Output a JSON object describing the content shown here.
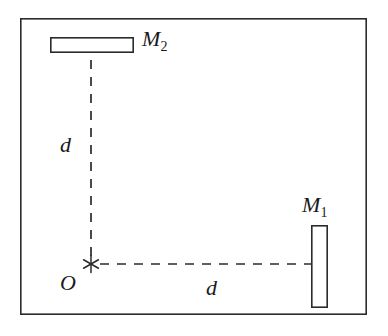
{
  "figure": {
    "background_color": "#ffffff",
    "line_color": "#2b2b2b",
    "text_color": "#1a1a1a",
    "frame": {
      "name": "outer-border",
      "x": 20,
      "y": 18,
      "width": 347,
      "height": 297,
      "stroke_width": 1.6,
      "fill": "#ffffff"
    },
    "mirrors": [
      {
        "id": "m1",
        "label": "M",
        "subscript": "1",
        "orientation": "vertical",
        "x": 311,
        "y": 225,
        "width": 17,
        "height": 83,
        "stroke_width": 1.6,
        "fill": "#ffffff"
      },
      {
        "id": "m2",
        "label": "M",
        "subscript": "2",
        "orientation": "horizontal",
        "x": 50,
        "y": 37,
        "width": 84,
        "height": 16,
        "stroke_width": 1.6,
        "fill": "#ffffff"
      }
    ],
    "origin": {
      "id": "origin",
      "label": "O",
      "marker": "asterisk-marker",
      "marker_points": 6,
      "x": 91,
      "y": 264,
      "radius": 9,
      "stroke_width": 1.5
    },
    "rays": [
      {
        "id": "ray-vertical",
        "from": "origin",
        "to": "m2",
        "x1": 91,
        "y1": 256,
        "x2": 91,
        "y2": 53,
        "style": "dashed",
        "dash_length": 9,
        "dash_gap": 8,
        "stroke_width": 1.6,
        "length_label": "d"
      },
      {
        "id": "ray-horizontal",
        "from": "origin",
        "to": "m1",
        "x1": 99,
        "y1": 264,
        "x2": 311,
        "y2": 264,
        "style": "dashed",
        "dash_length": 9,
        "dash_gap": 8,
        "stroke_width": 1.6,
        "length_label": "d"
      }
    ],
    "labels": {
      "m2": {
        "text": "M",
        "subscript": "2"
      },
      "m1": {
        "text": "M",
        "subscript": "1"
      },
      "distance_vertical": "d",
      "distance_horizontal": "d",
      "origin": "O"
    }
  }
}
